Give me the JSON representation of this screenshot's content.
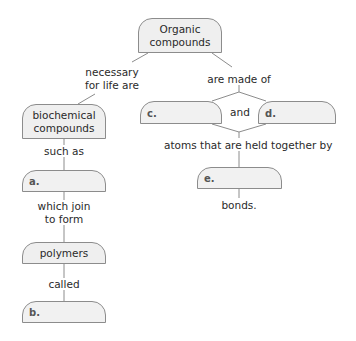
{
  "diagram": {
    "type": "concept-map",
    "colors": {
      "box_fill": "#efefef",
      "box_border": "#8c8c8c",
      "line": "#8c8c8c",
      "text": "#2a2a2a"
    },
    "nodes": {
      "root": "Organic compounds",
      "biochemical": "biochemical compounds",
      "a": "a.",
      "polymers": "polymers",
      "b": "b.",
      "c": "c.",
      "d": "d.",
      "e": "e."
    },
    "links": {
      "necessary": "necessary for life are",
      "made_of": "are made of",
      "such_as": "such as",
      "which_join": "which join to form",
      "called": "called",
      "and": "and",
      "atoms": "atoms that are held together by",
      "bonds": "bonds."
    },
    "text_lines": {
      "root_1": "Organic",
      "root_2": "compounds",
      "bio_1": "biochemical",
      "bio_2": "compounds",
      "necessary_1": "necessary",
      "necessary_2": "for life are",
      "which_1": "which join",
      "which_2": "to form"
    }
  }
}
